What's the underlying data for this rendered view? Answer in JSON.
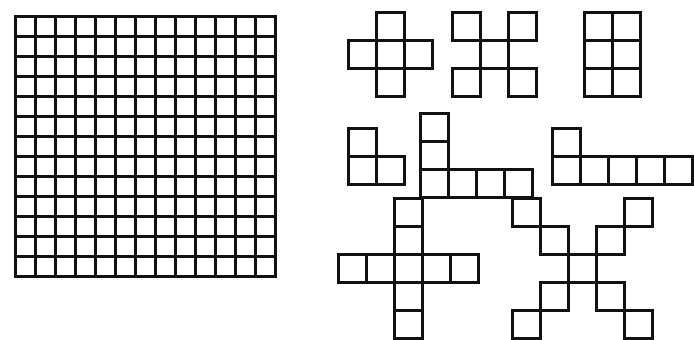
{
  "page": {
    "background_color": "#ffffff",
    "line_color": "#111111",
    "width": 654,
    "height": 328
  },
  "big_grid": {
    "name": "13-by-13 square grid",
    "rows": 13,
    "cols": 13,
    "cell_size": 20,
    "line_width": 3,
    "left": 14,
    "top": 15,
    "total_cells": 169
  },
  "shapes": [
    {
      "id": "plus-pentomino",
      "label": "plus pentomino",
      "rows": 3,
      "cols": 3,
      "cell_size": 28,
      "left": 18,
      "top": 12,
      "cell_count": 5,
      "cells": [
        [
          0,
          1,
          0
        ],
        [
          1,
          1,
          1
        ],
        [
          0,
          1,
          0
        ]
      ]
    },
    {
      "id": "x-pentomino",
      "label": "X pentomino",
      "rows": 3,
      "cols": 3,
      "cell_size": 28,
      "left": 122,
      "top": 12,
      "cell_count": 5,
      "cells": [
        [
          1,
          0,
          1
        ],
        [
          0,
          1,
          0
        ],
        [
          1,
          0,
          1
        ]
      ]
    },
    {
      "id": "rectangle-2x3",
      "label": "2 by 3 rectangle",
      "rows": 3,
      "cols": 2,
      "cell_size": 28,
      "left": 254,
      "top": 12,
      "cell_count": 6,
      "cells": [
        [
          1,
          1
        ],
        [
          1,
          1
        ],
        [
          1,
          1
        ]
      ]
    },
    {
      "id": "l-tromino",
      "label": "L tromino",
      "rows": 2,
      "cols": 2,
      "cell_size": 28,
      "left": 18,
      "top": 128,
      "cell_count": 3,
      "cells": [
        [
          1,
          0
        ],
        [
          1,
          1
        ]
      ]
    },
    {
      "id": "l-hexomino-tall",
      "label": "L hexomino with three tall stem",
      "rows": 3,
      "cols": 4,
      "cell_size": 28,
      "left": 90,
      "top": 113,
      "cell_count": 6,
      "cells": [
        [
          1,
          0,
          0,
          0
        ],
        [
          1,
          0,
          0,
          0
        ],
        [
          1,
          1,
          1,
          1
        ]
      ]
    },
    {
      "id": "l-hexomino-flat",
      "label": "L hexomino with five wide base",
      "rows": 2,
      "cols": 5,
      "cell_size": 28,
      "left": 222,
      "top": 128,
      "cell_count": 6,
      "cells": [
        [
          1,
          0,
          0,
          0,
          0
        ],
        [
          1,
          1,
          1,
          1,
          1
        ]
      ]
    },
    {
      "id": "plus-enneomino",
      "label": "large plus of nine squares",
      "rows": 5,
      "cols": 5,
      "cell_size": 28,
      "left": 8,
      "top": 198,
      "cell_count": 9,
      "cells": [
        [
          0,
          0,
          1,
          0,
          0
        ],
        [
          0,
          0,
          1,
          0,
          0
        ],
        [
          1,
          1,
          1,
          1,
          1
        ],
        [
          0,
          0,
          1,
          0,
          0
        ],
        [
          0,
          0,
          1,
          0,
          0
        ]
      ]
    },
    {
      "id": "x-enneomino",
      "label": "large diagonal cross of nine squares",
      "rows": 5,
      "cols": 5,
      "cell_size": 28,
      "left": 182,
      "top": 198,
      "cell_count": 9,
      "cells": [
        [
          1,
          0,
          0,
          0,
          1
        ],
        [
          0,
          1,
          0,
          1,
          0
        ],
        [
          0,
          0,
          1,
          0,
          0
        ],
        [
          0,
          1,
          0,
          1,
          0
        ],
        [
          1,
          0,
          0,
          0,
          1
        ]
      ]
    }
  ]
}
